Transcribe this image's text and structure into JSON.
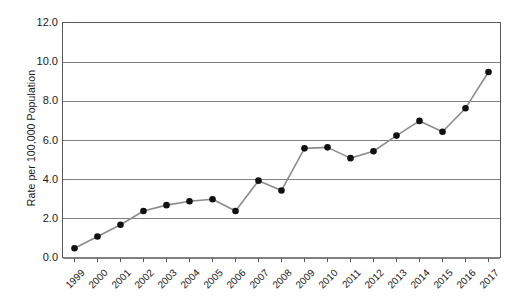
{
  "chart_data": {
    "type": "line",
    "title": "",
    "xlabel": "",
    "ylabel": "Rate per 100,000 Population",
    "ylim": [
      0.0,
      12.0
    ],
    "yticks": [
      "0.0",
      "2.0",
      "4.0",
      "6.0",
      "8.0",
      "10.0",
      "12.0"
    ],
    "ytick_values": [
      0.0,
      2.0,
      4.0,
      6.0,
      8.0,
      10.0,
      12.0
    ],
    "grid": "horizontal",
    "legend": "none",
    "categories": [
      "1999",
      "2000",
      "2001",
      "2002",
      "2003",
      "2004",
      "2005",
      "2006",
      "2007",
      "2008",
      "2009",
      "2010",
      "2011",
      "2012",
      "2013",
      "2014",
      "2015",
      "2016",
      "2017"
    ],
    "values": [
      0.5,
      1.1,
      1.7,
      2.4,
      2.7,
      2.9,
      3.0,
      2.4,
      3.95,
      3.45,
      5.6,
      5.65,
      5.1,
      5.45,
      6.25,
      7.0,
      6.45,
      7.65,
      9.5
    ],
    "marker": "filled-circle",
    "marker_color": "#111111",
    "line_color": "#8c8c8c",
    "axis_color": "#595959",
    "grid_color": "#808080",
    "background_color": "#ffffff"
  }
}
